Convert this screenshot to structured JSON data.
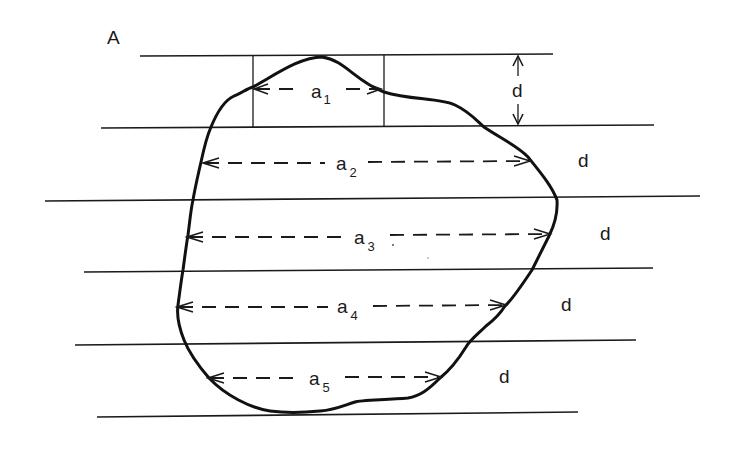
{
  "figure": {
    "panel_label": "A",
    "strip_spacing_label": "d",
    "colors": {
      "ink": "#1a1a1a",
      "background": "#ffffff"
    }
  },
  "strips": [
    {
      "index": 1,
      "chord_label": "a",
      "chord_subscript": "1",
      "spacing_label": "d"
    },
    {
      "index": 2,
      "chord_label": "a",
      "chord_subscript": "2",
      "spacing_label": "d"
    },
    {
      "index": 3,
      "chord_label": "a",
      "chord_subscript": "3",
      "spacing_label": "d"
    },
    {
      "index": 4,
      "chord_label": "a",
      "chord_subscript": "4",
      "spacing_label": "d"
    },
    {
      "index": 5,
      "chord_label": "a",
      "chord_subscript": "5",
      "spacing_label": "d"
    }
  ]
}
